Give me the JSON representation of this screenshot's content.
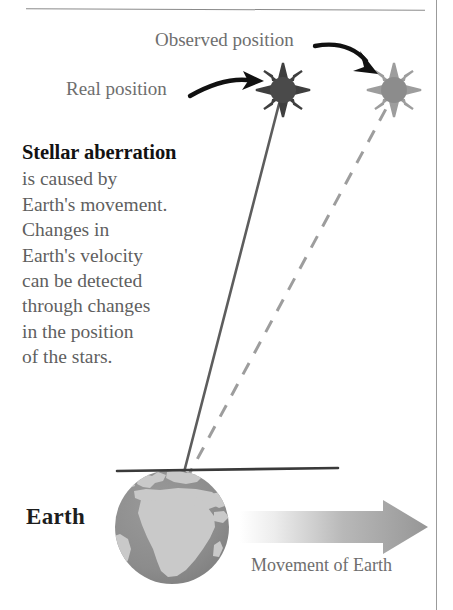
{
  "page": {
    "title": "Stellar aberration",
    "background": "#ffffff",
    "width": 453,
    "height": 610
  },
  "colors": {
    "text_gray": "#6e6e6e",
    "text_dark": "#121212",
    "star_real_fill": "#4a4a4a",
    "star_observed_fill": "#8c8c8c",
    "star_real_rays": "#3d3d3d",
    "star_observed_rays": "#9a9a9a",
    "sight_line_solid": "#585858",
    "sight_line_dashed": "#9a9a9a",
    "globe_ocean": "#8d8d8d",
    "globe_land": "#c9c9c9",
    "arrow_gradient_start": "#ffffff",
    "arrow_gradient_end": "#9a9a9a",
    "horizon_line": "#3a3a3a",
    "rule": "#8a8a8a"
  },
  "labels": {
    "observed_position": "Observed position",
    "real_position": "Real position",
    "earth": "Earth",
    "movement_of_earth": "Movement of Earth"
  },
  "body_text": {
    "headline": "Stellar aberration",
    "lines": [
      "is caused by",
      "Earth's movement.",
      "Changes in",
      "Earth's velocity",
      "can be detected",
      "through changes",
      "in the position",
      "of the stars."
    ],
    "full_text": "Stellar aberration is caused by Earth's movement. Changes in Earth's velocity can be detected through changes in the position of the stars."
  },
  "elements": {
    "star_real": {
      "name": "real-position-star",
      "cx": 283,
      "cy": 90,
      "radius": 13,
      "rays": 8
    },
    "star_observed": {
      "name": "observed-position-star",
      "cx": 394,
      "cy": 90,
      "radius": 13,
      "rays": 8
    },
    "globe": {
      "name": "earth-globe",
      "cx": 172,
      "cy": 527,
      "radius": 57
    },
    "horizon": {
      "name": "horizon-line",
      "x1": 117,
      "y1": 471,
      "x2": 338,
      "y2": 468
    },
    "sight_line_real": {
      "name": "real-sight-line",
      "x1": 182,
      "y1": 478,
      "x2": 278,
      "y2": 106,
      "style": "solid"
    },
    "sight_line_observed": {
      "name": "observed-sight-line",
      "x1": 185,
      "y1": 478,
      "x2": 386,
      "y2": 108,
      "style": "dashed"
    },
    "motion_arrow": {
      "name": "earth-motion-arrow",
      "x": 240,
      "y": 500,
      "width": 188,
      "height": 54
    },
    "pointer_real": {
      "name": "real-position-pointer-arrow"
    },
    "pointer_observed": {
      "name": "observed-position-pointer-arrow"
    }
  }
}
